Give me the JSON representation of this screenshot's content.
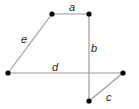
{
  "diagram": {
    "type": "graph",
    "vertices": [
      {
        "id": "v1",
        "x": 52,
        "y": 14
      },
      {
        "id": "v2",
        "x": 89,
        "y": 14
      },
      {
        "id": "v3",
        "x": 8,
        "y": 73
      },
      {
        "id": "v4",
        "x": 123,
        "y": 73
      },
      {
        "id": "v5",
        "x": 89,
        "y": 101
      }
    ],
    "edges": [
      {
        "label": "a",
        "from": "v1",
        "to": "v2",
        "label_x": 72,
        "label_y": 11
      },
      {
        "label": "b",
        "from": "v2",
        "to": "v5",
        "label_x": 94,
        "label_y": 52
      },
      {
        "label": "c",
        "from": "v4",
        "to": "v5",
        "label_x": 108,
        "label_y": 101
      },
      {
        "label": "d",
        "from": "v3",
        "to": "v4",
        "label_x": 53,
        "label_y": 71
      },
      {
        "label": "e",
        "from": "v3",
        "to": "v1",
        "label_x": 23,
        "label_y": 43
      }
    ],
    "colors": {
      "edge": "#9a9a9a",
      "vertex": "#000000",
      "label": "#222222"
    }
  }
}
